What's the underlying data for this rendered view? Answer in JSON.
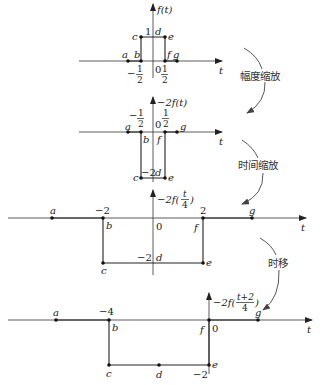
{
  "diagram": {
    "colors": {
      "line": "#222222",
      "axis": "#333333",
      "background": "#ffffff"
    },
    "axis_label": "t",
    "transforms": [
      {
        "label": "幅度缩放"
      },
      {
        "label": "时间缩放"
      },
      {
        "label": "时移"
      }
    ],
    "plots": [
      {
        "title": "f(t)",
        "points": [
          "a",
          "b",
          "c",
          "d",
          "e",
          "f",
          "g"
        ],
        "level_label": "1",
        "ticks": {
          "left_num": "−",
          "left_n": "1",
          "left_d": "2",
          "origin": "0",
          "right_n": "1",
          "right_d": "2"
        }
      },
      {
        "title": "−2f(t)",
        "points": [
          "a",
          "b",
          "c",
          "d",
          "e",
          "f",
          "g"
        ],
        "level_label": "−2",
        "ticks": {
          "left_num": "−",
          "left_n": "1",
          "left_d": "2",
          "origin": "0",
          "right_n": "1",
          "right_d": "2"
        }
      },
      {
        "title_prefix": "−2f(",
        "title_n": "t",
        "title_d": "4",
        "title_suffix": ")",
        "points": [
          "a",
          "b",
          "c",
          "d",
          "e",
          "f",
          "g"
        ],
        "level_label": "−2",
        "ticks": {
          "left": "−2",
          "origin": "0",
          "right": "2"
        }
      },
      {
        "title_prefix": "−2f(",
        "title_n": "t+2",
        "title_d": "4",
        "title_suffix": ")",
        "points": [
          "a",
          "b",
          "c",
          "d",
          "e",
          "f",
          "g"
        ],
        "level_label": "−2",
        "ticks": {
          "left": "−4",
          "origin": "0"
        }
      }
    ]
  }
}
